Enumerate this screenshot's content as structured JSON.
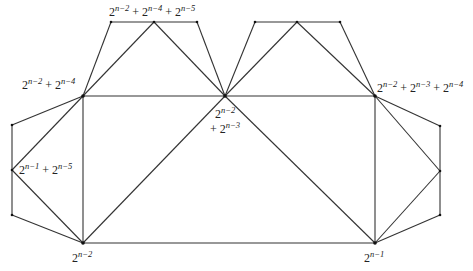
{
  "diagram": {
    "type": "graph",
    "stroke_color": "#333333",
    "vertices": [
      {
        "id": "t1",
        "x": 111,
        "y": 22
      },
      {
        "id": "t2",
        "x": 154,
        "y": 22
      },
      {
        "id": "t3",
        "x": 197,
        "y": 22
      },
      {
        "id": "t4",
        "x": 255,
        "y": 22
      },
      {
        "id": "t5",
        "x": 297,
        "y": 22
      },
      {
        "id": "t6",
        "x": 340,
        "y": 22
      },
      {
        "id": "A",
        "x": 83,
        "y": 96
      },
      {
        "id": "C",
        "x": 225,
        "y": 96
      },
      {
        "id": "R",
        "x": 375,
        "y": 96
      },
      {
        "id": "l1",
        "x": 12,
        "y": 125
      },
      {
        "id": "l2",
        "x": 12,
        "y": 170
      },
      {
        "id": "l3",
        "x": 12,
        "y": 215
      },
      {
        "id": "B1",
        "x": 83,
        "y": 243
      },
      {
        "id": "B2",
        "x": 375,
        "y": 243
      },
      {
        "id": "r1",
        "x": 440,
        "y": 126
      },
      {
        "id": "r2",
        "x": 440,
        "y": 171
      },
      {
        "id": "r3",
        "x": 440,
        "y": 215
      }
    ],
    "edges": [
      [
        "t1",
        "t3"
      ],
      [
        "A",
        "t1"
      ],
      [
        "A",
        "t2"
      ],
      [
        "t2",
        "C"
      ],
      [
        "t3",
        "C"
      ],
      [
        "t4",
        "t6"
      ],
      [
        "C",
        "t4"
      ],
      [
        "C",
        "t5"
      ],
      [
        "t5",
        "R"
      ],
      [
        "t6",
        "R"
      ],
      [
        "A",
        "C"
      ],
      [
        "C",
        "R"
      ],
      [
        "A",
        "B1"
      ],
      [
        "R",
        "B2"
      ],
      [
        "B1",
        "B2"
      ],
      [
        "C",
        "B1"
      ],
      [
        "C",
        "B2"
      ],
      [
        "A",
        "l1"
      ],
      [
        "A",
        "l2"
      ],
      [
        "l1",
        "l3"
      ],
      [
        "l2",
        "B1"
      ],
      [
        "l3",
        "B1"
      ],
      [
        "R",
        "r1"
      ],
      [
        "R",
        "r2"
      ],
      [
        "r1",
        "r3"
      ],
      [
        "r2",
        "B2"
      ],
      [
        "r3",
        "B2"
      ]
    ],
    "labels": {
      "top_left": {
        "parts": [
          {
            "base": "2",
            "exp": "n−2"
          },
          {
            "op": " + "
          },
          {
            "base": "2",
            "exp": "n−4"
          },
          {
            "op": " + "
          },
          {
            "base": "2",
            "exp": "n−5"
          }
        ]
      },
      "left_upper": {
        "parts": [
          {
            "base": "2",
            "exp": "n−2"
          },
          {
            "op": " + "
          },
          {
            "base": "2",
            "exp": "n−4"
          }
        ]
      },
      "left_mid": {
        "parts": [
          {
            "base": "2",
            "exp": "n−1"
          },
          {
            "op": " + "
          },
          {
            "base": "2",
            "exp": "n−5"
          }
        ]
      },
      "center_line1": {
        "parts": [
          {
            "base": "2",
            "exp": "n−2"
          }
        ]
      },
      "center_line2": {
        "parts": [
          {
            "op": "+ "
          },
          {
            "base": "2",
            "exp": "n−3"
          }
        ]
      },
      "right_upper": {
        "parts": [
          {
            "base": "2",
            "exp": "n−2"
          },
          {
            "op": " + "
          },
          {
            "base": "2",
            "exp": "n−3"
          },
          {
            "op": " + "
          },
          {
            "base": "2",
            "exp": "n−4"
          }
        ]
      },
      "bottom_left": {
        "parts": [
          {
            "base": "2",
            "exp": "n−2"
          }
        ]
      },
      "bottom_right": {
        "parts": [
          {
            "base": "2",
            "exp": "n−1"
          }
        ]
      }
    }
  }
}
